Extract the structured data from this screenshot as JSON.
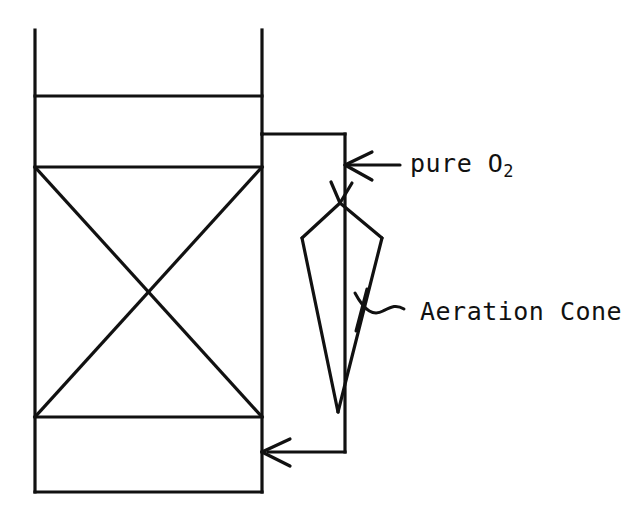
{
  "diagram": {
    "stroke_color": "#111111",
    "background_color": "#ffffff",
    "labels": {
      "pure_oxygen": {
        "text_main": "pure O",
        "text_subscript": "2",
        "full_text": "pure O2",
        "name": "pure-oxygen-label"
      },
      "aeration_cone": {
        "text": "Aeration Cone",
        "name": "aeration-cone-label"
      }
    },
    "parts": {
      "vessel": "vertical-column-vessel",
      "upper_chamber": "upper-freeboard-section",
      "mid_band": "upper-divider-band",
      "packed_section": "cross-braced-packed-section",
      "lower_chamber": "lower-sump-section",
      "recirculation_pipe": "external-recirculation-pipe",
      "oxygen_inlet_arrow": "oxygen-inlet-arrow",
      "return_arrow": "recirculation-return-arrow",
      "downflow_arrow": "downflow-arrow",
      "cone": "aeration-cone-plume",
      "leader": "aeration-cone-leader-squiggle"
    }
  },
  "geometry": {
    "vessel": {
      "left_x": 35,
      "right_x": 262,
      "top_y": 30,
      "bottom_y": 492,
      "divider1_y": 96,
      "divider2_y": 167,
      "divider3_y": 417
    },
    "pipe": {
      "top_y": 134,
      "right_x": 345,
      "bottom_y": 452
    },
    "cone": {
      "apex_x": 340,
      "apex_y": 203,
      "left_x": 302,
      "shoulder_y": 238,
      "right_x": 382,
      "tip_x": 338,
      "tip_y": 412
    },
    "arrows": {
      "oxygen_inlet_y": 165,
      "oxygen_inlet_tail_x": 400,
      "downflow_y": 200,
      "return_y": 452
    }
  }
}
